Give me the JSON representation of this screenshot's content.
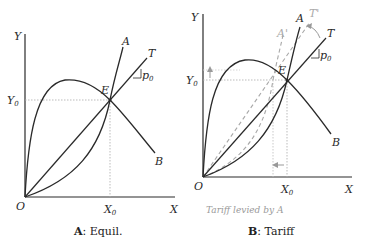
{
  "panels": [
    {
      "id": "A",
      "caption_letter": "A",
      "caption_text": ": Equil.",
      "labels": {
        "y_axis": "Y",
        "x_axis": "X",
        "origin": "O",
        "y0": "Y",
        "y0_sub": "0",
        "x0": "X",
        "x0_sub": "0",
        "curve_a": "A",
        "curve_b": "B",
        "line_t": "T",
        "point_e": "E",
        "price": "p",
        "price_sub": "0"
      }
    },
    {
      "id": "B",
      "caption_letter": "B",
      "caption_text": ": Tariff",
      "note": "Tariff levied by A",
      "labels": {
        "y_axis": "Y",
        "x_axis": "X",
        "origin": "O",
        "y0": "Y",
        "y0_sub": "0",
        "x0": "X",
        "x0_sub": "0",
        "curve_a": "A",
        "curve_a_shifted": "A'",
        "curve_b": "B",
        "line_t": "T",
        "line_t_shifted": "T'",
        "point_e": "E",
        "price": "p",
        "price_sub": "0"
      }
    }
  ],
  "colors": {
    "curve": "#2a2a2a",
    "shifted": "#a8a8a8",
    "guide": "#aaaaaa"
  }
}
